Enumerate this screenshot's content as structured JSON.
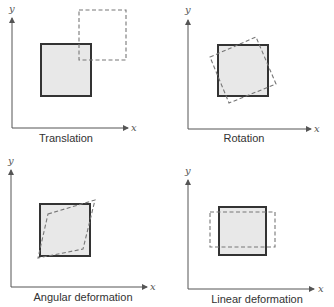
{
  "figure": {
    "panels": [
      {
        "id": "translation",
        "caption": "Translation",
        "x_axis_label": "x",
        "y_axis_label": "y"
      },
      {
        "id": "rotation",
        "caption": "Rotation",
        "x_axis_label": "x",
        "y_axis_label": "y"
      },
      {
        "id": "angular",
        "caption": "Angular deformation",
        "x_axis_label": "x",
        "y_axis_label": "y"
      },
      {
        "id": "linear",
        "caption": "Linear deformation",
        "x_axis_label": "x",
        "y_axis_label": "y"
      }
    ],
    "legend_meaning": {
      "solid_square": "original fluid element",
      "dashed_shape": "element after motion"
    },
    "colors": {
      "solid_fill": "#e8e8e8",
      "solid_stroke": "#333333",
      "dashed_stroke": "#777777",
      "axis": "#555555"
    }
  }
}
